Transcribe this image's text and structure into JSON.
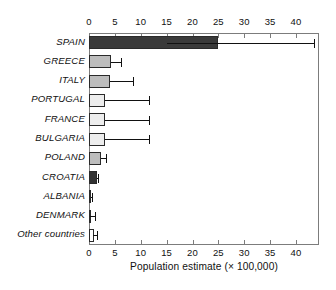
{
  "chart_data": {
    "type": "bar",
    "orientation": "horizontal",
    "title": "",
    "xlabel": "Population estimate (× 100,000)",
    "ylabel": "",
    "xlim": [
      0,
      44
    ],
    "xticks": [
      0,
      5,
      10,
      15,
      20,
      25,
      30,
      35,
      40
    ],
    "xticklabels": [
      "0",
      "5",
      "10",
      "15",
      "20",
      "25",
      "30",
      "35",
      "40"
    ],
    "grid": false,
    "legend": "none",
    "axis_top_duplicate": true,
    "categories": [
      "SPAIN",
      "GREECE",
      "ITALY",
      "PORTUGAL",
      "FRANCE",
      "BULGARIA",
      "POLAND",
      "CROATIA",
      "ALBANIA",
      "DENMARK",
      "Other countries"
    ],
    "values": [
      25.0,
      4.2,
      4.0,
      3.0,
      3.0,
      3.0,
      2.4,
      1.5,
      0.4,
      0.3,
      1.0
    ],
    "error_low": [
      15.0,
      4.2,
      4.0,
      3.0,
      3.0,
      3.0,
      2.4,
      1.5,
      0.4,
      0.2,
      0.8
    ],
    "error_high": [
      43.5,
      6.2,
      8.5,
      11.5,
      11.5,
      11.5,
      3.2,
      1.8,
      0.5,
      1.1,
      1.6
    ],
    "bar_colors": [
      "#3a3a3a",
      "#bdbdbd",
      "#bdbdbd",
      "#ededed",
      "#ededed",
      "#ededed",
      "#bdbdbd",
      "#333333",
      "#ededed",
      "#ededed",
      "#ffffff"
    ],
    "axis_color": "#7c7c7c",
    "bar_edge_color": "#2a2a2a",
    "error_color": "#111111"
  }
}
